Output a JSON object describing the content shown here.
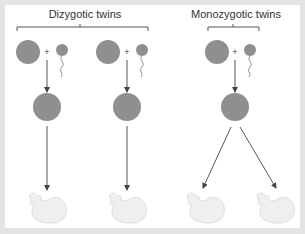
{
  "groups": [
    {
      "id": "dizygotic",
      "label": "Dizygotic twins",
      "bracket": {
        "x1": 17,
        "x2": 148,
        "y": 27
      }
    },
    {
      "id": "monozygotic",
      "label": "Monozygotic twins",
      "bracket": {
        "x1": 208,
        "x2": 259,
        "y": 27
      }
    }
  ],
  "plus_sign": "+",
  "colors": {
    "cell": "#8f8f8f",
    "sperm": "#8f8f8f",
    "arrow": "#444444",
    "embryo_fill": "#efefef",
    "embryo_stroke": "#d8d8d8",
    "frame_bg": "#e4e4e4",
    "panel_bg": "#ffffff"
  },
  "fertilizations": [
    {
      "egg_cx": 28,
      "sperm_cx": 62,
      "plus_x": 47,
      "y": 52
    },
    {
      "egg_cx": 108,
      "sperm_cx": 142,
      "plus_x": 127,
      "y": 52
    },
    {
      "egg_cx": 217,
      "sperm_cx": 250,
      "plus_x": 235,
      "y": 52
    }
  ],
  "zygotes": [
    {
      "cx": 47,
      "cy": 107
    },
    {
      "cx": 127,
      "cy": 107
    },
    {
      "cx": 235,
      "cy": 107
    }
  ],
  "embryos": [
    {
      "x": 47,
      "y": 205
    },
    {
      "x": 127,
      "y": 205
    },
    {
      "x": 205,
      "y": 205
    },
    {
      "x": 275,
      "y": 205
    }
  ]
}
